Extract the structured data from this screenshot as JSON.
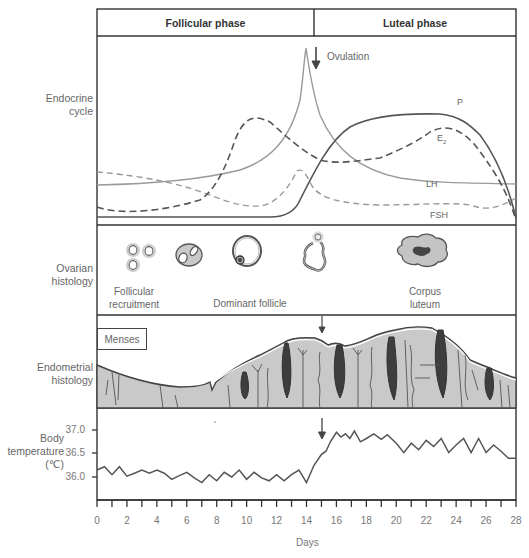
{
  "header": {
    "follicular_label": "Follicular phase",
    "luteal_label": "Luteal phase"
  },
  "rows": {
    "endocrine": "Endocrine\ncycle",
    "ovarian": "Ovarian\nhistology",
    "endometrial": "Endometrial\nhistology",
    "temperature": "Body\ntemperature\n(℃)"
  },
  "annotations": {
    "ovulation": "Ovulation",
    "menses": "Menses"
  },
  "ovarian_captions": {
    "follicular_recruitment": "Follicular\nrecruitment",
    "dominant_follicle": "Dominant follicle",
    "corpus_luteum": "Corpus\nluteum"
  },
  "curve_labels": {
    "P": "P",
    "E2": "E",
    "E2_sub": "2",
    "LH": "LH",
    "FSH": "FSH"
  },
  "x_axis": {
    "label": "Days",
    "ticks": [
      "0",
      "2",
      "4",
      "6",
      "8",
      "10",
      "12",
      "14",
      "16",
      "18",
      "20",
      "22",
      "24",
      "26",
      "28"
    ]
  },
  "y_axis": {
    "ticks": [
      "37.0",
      "36.5",
      "36.0"
    ]
  },
  "colors": {
    "frame": "#333333",
    "curve_dark": "#555555",
    "curve_light": "#999999",
    "tissue": "#c8c8c8",
    "gland_dark": "#3a3a3a"
  },
  "chart_data": [
    {
      "type": "line",
      "title": "Endocrine cycle (relative hormone levels)",
      "xlabel": "Days",
      "ylabel": "Relative level",
      "x": [
        0,
        2,
        4,
        6,
        8,
        10,
        12,
        13,
        14,
        15,
        16,
        18,
        20,
        22,
        24,
        26,
        27,
        28
      ],
      "series": [
        {
          "name": "LH",
          "style": "solid light",
          "values": [
            0.25,
            0.26,
            0.28,
            0.31,
            0.36,
            0.44,
            0.56,
            0.68,
            1.0,
            0.65,
            0.45,
            0.3,
            0.22,
            0.16,
            0.13,
            0.12,
            0.11,
            0.1
          ]
        },
        {
          "name": "FSH",
          "style": "dashed light",
          "values": [
            0.25,
            0.22,
            0.18,
            0.14,
            0.1,
            0.05,
            0.05,
            0.15,
            0.25,
            0.12,
            0.06,
            0.05,
            0.05,
            0.06,
            0.06,
            0.04,
            0.06,
            0.08
          ]
        },
        {
          "name": "E2",
          "style": "dashed dark",
          "values": [
            0.05,
            0.0,
            0.01,
            0.05,
            0.15,
            0.4,
            0.55,
            0.45,
            0.28,
            0.18,
            0.18,
            0.21,
            0.28,
            0.38,
            0.5,
            0.3,
            0.12,
            0.0
          ]
        },
        {
          "name": "P",
          "style": "solid dark",
          "values": [
            0.0,
            0.0,
            0.0,
            0.0,
            0.0,
            0.0,
            0.0,
            0.02,
            0.1,
            0.3,
            0.42,
            0.57,
            0.62,
            0.63,
            0.62,
            0.52,
            0.3,
            0.0
          ]
        }
      ],
      "annotations": [
        "Ovulation ~day 14.5"
      ]
    },
    {
      "type": "line",
      "title": "Body temperature",
      "xlabel": "Days",
      "ylabel": "Body temperature (℃)",
      "ylim": [
        35.5,
        37.4
      ],
      "y_ticks": [
        36.0,
        36.5,
        37.0
      ],
      "x": [
        0,
        0.5,
        1,
        1.5,
        2,
        2.5,
        3,
        3.5,
        4,
        4.5,
        5,
        5.5,
        6,
        6.5,
        7,
        7.5,
        8,
        8.5,
        9,
        9.5,
        10,
        10.5,
        11,
        11.5,
        12,
        12.5,
        13,
        13.5,
        14,
        14.5,
        15,
        15.3,
        15.6,
        16,
        16.3,
        16.6,
        16.9,
        17.2,
        17.6,
        18,
        18.5,
        19,
        19.4,
        20,
        20.5,
        21,
        21.5,
        22,
        22.5,
        23,
        23.5,
        24,
        24.5,
        25,
        25.5,
        26,
        26.5,
        27,
        27.5,
        28
      ],
      "values": [
        36.15,
        36.22,
        36.05,
        36.22,
        36.02,
        36.08,
        36.15,
        36.08,
        36.15,
        36.08,
        35.95,
        36.03,
        36.1,
        35.98,
        35.88,
        36.05,
        35.92,
        36.1,
        36.0,
        36.15,
        35.95,
        36.1,
        35.98,
        35.92,
        36.05,
        35.92,
        36.05,
        36.15,
        35.88,
        36.25,
        36.48,
        36.55,
        36.75,
        36.95,
        36.85,
        36.92,
        36.82,
        36.98,
        36.75,
        36.82,
        36.92,
        36.8,
        36.9,
        36.72,
        36.52,
        36.72,
        36.58,
        36.78,
        36.65,
        36.82,
        36.52,
        36.68,
        36.82,
        36.52,
        36.82,
        36.52,
        36.68,
        36.55,
        36.4,
        36.4
      ],
      "annotations": [
        "Ovulation arrow at ~day 15.2"
      ]
    }
  ]
}
